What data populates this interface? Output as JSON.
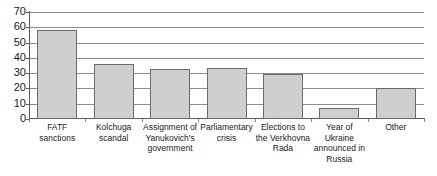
{
  "chart_data": {
    "type": "bar",
    "title": "",
    "subtitle": "",
    "xlabel": "",
    "ylabel": "",
    "ylim": [
      0,
      70
    ],
    "ytick_step": 10,
    "yticks": [
      70,
      60,
      50,
      40,
      30,
      20,
      10,
      0
    ],
    "grid": true,
    "legend": false,
    "legend_position": "none",
    "bar_fill_color": "#cfcfcf",
    "bar_border_color": "#6b6b6b",
    "axis_color": "#5a5a5a",
    "gridline_color": "#8d8d8d",
    "categories": [
      "FATF sanctions",
      "Kolchuga scandal",
      "Assignment of Yanukovich's government",
      "Parliamentary crisis",
      "Elections to the Verkhovna Rada",
      "Year of Ukraine announced in Russia",
      "Other"
    ],
    "values": [
      58,
      36,
      33,
      33.5,
      29.5,
      7.5,
      20
    ]
  }
}
